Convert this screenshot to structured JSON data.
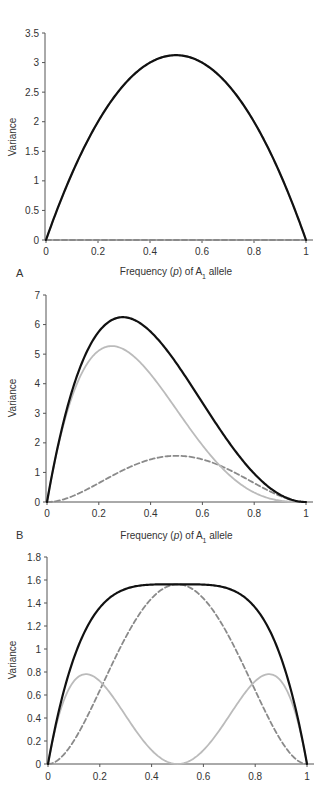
{
  "chart_data": [
    {
      "type": "line",
      "panel_label": "",
      "title": "",
      "xlabel_parts": [
        "Frequency (",
        "p",
        ") of A",
        "1",
        " allele"
      ],
      "ylabel": "Variance",
      "xlim": [
        0,
        1
      ],
      "ylim": [
        0,
        3.5
      ],
      "xticks": [
        0,
        0.2,
        0.4,
        0.6,
        0.8,
        1
      ],
      "xtick_labels": [
        "0",
        "0.2",
        "0.4",
        "0.6",
        "0.8",
        "1"
      ],
      "yticks": [
        0,
        0.5,
        1,
        1.5,
        2,
        2.5,
        3,
        3.5
      ],
      "ytick_labels": [
        "0",
        "0.5",
        "1",
        "1.5",
        "2",
        "2.5",
        "3",
        "3.5"
      ],
      "grid": false,
      "model": {
        "a": 2.5,
        "d": 0
      },
      "x": [
        0,
        0.1,
        0.2,
        0.3,
        0.4,
        0.5,
        0.6,
        0.7,
        0.8,
        0.9,
        1
      ],
      "series": [
        {
          "name": "Total (genetic) variance",
          "style": "solid-black",
          "values": [
            0,
            1.125,
            2.0,
            2.625,
            3.0,
            3.125,
            3.0,
            2.625,
            2.0,
            1.125,
            0
          ]
        },
        {
          "name": "Additive variance",
          "style": "solid-grey",
          "values": [
            0,
            1.125,
            2.0,
            2.625,
            3.0,
            3.125,
            3.0,
            2.625,
            2.0,
            1.125,
            0
          ]
        },
        {
          "name": "Dominance variance",
          "style": "dashed-grey",
          "values": [
            0,
            0,
            0,
            0,
            0,
            0,
            0,
            0,
            0,
            0,
            0
          ]
        }
      ]
    },
    {
      "type": "line",
      "panel_label": "A",
      "title": "",
      "xlabel_parts": [
        "Frequency (",
        "p",
        ") of A",
        "1",
        " allele"
      ],
      "ylabel": "Variance",
      "xlim": [
        0,
        1
      ],
      "ylim": [
        0,
        7
      ],
      "xticks": [
        0,
        0.2,
        0.4,
        0.6,
        0.8,
        1
      ],
      "xtick_labels": [
        "0",
        "0.2",
        "0.4",
        "0.6",
        "0.8",
        "1"
      ],
      "yticks": [
        0,
        1,
        2,
        3,
        4,
        5,
        6,
        7
      ],
      "ytick_labels": [
        "0",
        "1",
        "2",
        "3",
        "4",
        "5",
        "6",
        "7"
      ],
      "grid": false,
      "model": {
        "a": 2.5,
        "d": 2.5
      },
      "x": [
        0,
        0.1,
        0.2,
        0.25,
        0.3,
        0.4,
        0.5,
        0.6,
        0.7,
        0.8,
        0.9,
        1
      ],
      "series": [
        {
          "name": "Total (genetic) variance",
          "style": "solid-black",
          "values": [
            0,
            4.7,
            6.1,
            6.2,
            6.25,
            5.76,
            4.69,
            3.36,
            2.03,
            0.89,
            0.19,
            0
          ]
        },
        {
          "name": "Additive variance",
          "style": "solid-grey",
          "values": [
            0,
            4.56,
            5.12,
            5.27,
            5.15,
            4.32,
            3.13,
            1.92,
            0.95,
            0.32,
            0.04,
            0
          ]
        },
        {
          "name": "Dominance variance",
          "style": "dashed-grey",
          "values": [
            0,
            0.2,
            0.64,
            0.88,
            1.1,
            1.44,
            1.56,
            1.44,
            1.1,
            0.64,
            0.2,
            0
          ]
        }
      ]
    },
    {
      "type": "line",
      "panel_label": "B",
      "title": "",
      "xlabel_parts": [],
      "ylabel": "Variance",
      "xlim": [
        0,
        1
      ],
      "ylim": [
        0,
        1.8
      ],
      "xticks": [
        0,
        0.2,
        0.4,
        0.6,
        0.8,
        1
      ],
      "xtick_labels": [
        "0",
        "0.2",
        "0.4",
        "0.6",
        "0.8",
        "1"
      ],
      "yticks": [
        0,
        0.2,
        0.4,
        0.6,
        0.8,
        1,
        1.2,
        1.4,
        1.6,
        1.8
      ],
      "ytick_labels": [
        "0",
        "0.2",
        "0.4",
        "0.6",
        "0.8",
        "1",
        "1.2",
        "1.4",
        "1.6",
        "1.8"
      ],
      "grid": false,
      "model": {
        "a": 0,
        "d": 2.5
      },
      "x": [
        0,
        0.1,
        0.15,
        0.2,
        0.3,
        0.4,
        0.5,
        0.6,
        0.7,
        0.8,
        0.85,
        0.9,
        1
      ],
      "series": [
        {
          "name": "Total (genetic) variance",
          "style": "solid-black",
          "values": [
            0,
            0.92,
            1.2,
            1.36,
            1.54,
            1.6,
            1.56,
            1.6,
            1.54,
            1.36,
            1.2,
            0.92,
            0
          ]
        },
        {
          "name": "Additive variance",
          "style": "solid-grey",
          "values": [
            0,
            0.72,
            0.78,
            0.72,
            0.42,
            0.12,
            0,
            0.12,
            0.42,
            0.72,
            0.78,
            0.72,
            0
          ]
        },
        {
          "name": "Dominance variance",
          "style": "dashed-grey",
          "values": [
            0,
            0.2,
            0.41,
            0.64,
            1.1,
            1.44,
            1.56,
            1.44,
            1.1,
            0.64,
            0.41,
            0.2,
            0
          ]
        }
      ]
    }
  ],
  "styles": {
    "solid-black": {
      "color": "#111111",
      "dash": ""
    },
    "solid-grey": {
      "color": "#bbbbbb",
      "dash": ""
    },
    "dashed-grey": {
      "color": "#8a8a8a",
      "dash": "5,3"
    },
    "axis_color": "#555555"
  }
}
